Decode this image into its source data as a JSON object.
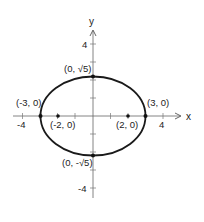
{
  "figure": {
    "type": "ellipse-graph",
    "equation_implied": "x^2/9 + y^2/5 = 1",
    "axes": {
      "x_label": "x",
      "y_label": "y",
      "x_ticks": [
        "-4",
        "4"
      ],
      "y_ticks": [
        "4",
        "-4"
      ]
    },
    "points": [
      {
        "name": "vertex-left",
        "label": "(-3, 0)",
        "x": -3,
        "y": 0
      },
      {
        "name": "vertex-right",
        "label": "(3, 0)",
        "x": 3,
        "y": 0
      },
      {
        "name": "covertex-top",
        "label": "(0, √5)",
        "x": 0,
        "y": 2.236
      },
      {
        "name": "covertex-bottom",
        "label": "(0, -√5)",
        "x": 0,
        "y": -2.236
      },
      {
        "name": "focus-left",
        "label": "(-2, 0)",
        "x": -2,
        "y": 0
      },
      {
        "name": "focus-right",
        "label": "(2, 0)",
        "x": 2,
        "y": 0
      }
    ],
    "colors": {
      "stroke": "#1a1a1a",
      "axis": "#555555",
      "text": "#222222"
    }
  }
}
